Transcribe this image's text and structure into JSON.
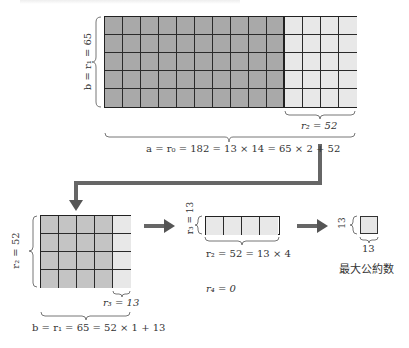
{
  "colors": {
    "dark_fill": "#a9a9a9",
    "medium_fill": "#c4c4c4",
    "light_fill": "#e8e8e8",
    "grid_line": "#2a2a2a",
    "arrow": "#666666",
    "text": "#333333"
  },
  "step1": {
    "grid": {
      "columns": 14,
      "rows": 5,
      "dark_columns": 10,
      "light_columns": 4
    },
    "side_label": "b = r₁ = 65",
    "remainder_label": "r₂ = 52",
    "formula": "a = r₀ = 182 = 13 × 14 = 65 × 2 + 52"
  },
  "step2": {
    "grid": {
      "columns": 5,
      "rows": 4,
      "dark_columns": 4,
      "light_columns": 1
    },
    "side_label": "r₂ = 52",
    "remainder_label": "r₃ = 13",
    "formula": "b = r₁ = 65 = 52 × 1 + 13"
  },
  "step3": {
    "grid": {
      "columns": 4,
      "rows": 1
    },
    "side_label": "r₃ = 13",
    "formula": "r₂ = 52 = 13 × 4",
    "remainder_label": "r₄ = 0"
  },
  "result": {
    "side_label": "13",
    "bottom_label": "13",
    "caption": "最大公約数"
  },
  "arrows": [
    {
      "name": "step1-to-step2",
      "type": "elbow",
      "direction": "down-left"
    },
    {
      "name": "step2-to-step3",
      "type": "straight",
      "direction": "right"
    },
    {
      "name": "step3-to-result",
      "type": "straight",
      "direction": "right"
    }
  ]
}
